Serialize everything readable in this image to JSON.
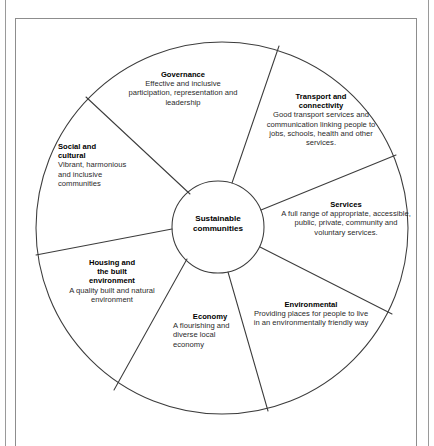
{
  "figure": {
    "type": "wheel-diagram",
    "hub": {
      "line1": "Sustainable",
      "line2": "communities"
    },
    "segments": [
      {
        "id": "governance",
        "title": "Governance",
        "description": "Effective and inclusive participation, representation and leadership",
        "align": "center"
      },
      {
        "id": "transport",
        "title_line1": "Transport and",
        "title_line2": "connectivity",
        "description": "Good transport services and communication linking people to jobs, schools, health and other services.",
        "align": "center"
      },
      {
        "id": "services",
        "title": "Services",
        "description": "A full range of appropriate, accessible, public, private, community and voluntary services.",
        "align": "center"
      },
      {
        "id": "environmental",
        "title": "Environmental",
        "description": "Providing places for people to live in an environmentally friendly way",
        "align": "center"
      },
      {
        "id": "economy",
        "title": "Economy",
        "description": "A flourishing and diverse local economy",
        "align": "left"
      },
      {
        "id": "housing",
        "title_line1": "Housing and",
        "title_line2": "the built",
        "title_line3": "environment",
        "description": "A quality built and natural environment",
        "align": "center"
      },
      {
        "id": "social",
        "title_line1": "Social and",
        "title_line2": "cultural",
        "description": "Vibrant, harmonious and inclusive communities",
        "align": "left"
      }
    ],
    "colors": {
      "stroke": "#3c3c3c",
      "frame": "#8d8d8d",
      "rule": "#9a9a9a",
      "text": "#1b1b1b",
      "background": "#ffffff"
    }
  }
}
